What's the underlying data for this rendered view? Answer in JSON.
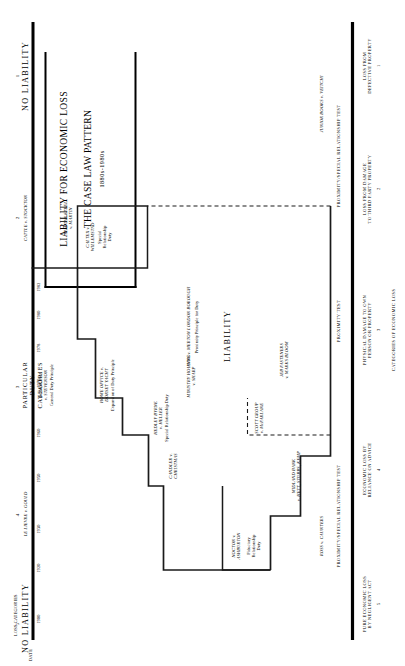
{
  "diagram": {
    "title_line1": "LIABILITY FOR ECONOMIC LOSS",
    "title_line2": "THE CASE LAW PATTERN",
    "title_sub": "1880s-1980s"
  },
  "axes": {
    "date_axis_label": "DATE",
    "loss_categories_label": "LOSS CATEGORIES",
    "dates": [
      "1900",
      "1920",
      "1930",
      "1950",
      "1960",
      "1970",
      "1978",
      "1980",
      "1982"
    ]
  },
  "column_numbers": [
    "5",
    "4",
    "3",
    "2",
    "1"
  ],
  "zones": [
    {
      "label": "NO LIABILITY",
      "id": "no-liability-left"
    },
    {
      "label": "LIABILITY",
      "id": "liability"
    },
    {
      "label": "NO LIABILITY",
      "id": "no-liability-right"
    }
  ],
  "column_headers": [
    {
      "num": "5",
      "name": ""
    },
    {
      "num": "4",
      "name": "LE LIEVRE v. GOULD"
    },
    {
      "num": "3",
      "name": "PARTICULAR DUTY CATEGORIES"
    },
    {
      "num": "2",
      "name": "CATTLE v. STOCKTON"
    },
    {
      "num": "1",
      "name": ""
    }
  ],
  "cases": [
    {
      "name": "LE LIEVRE v. GOULD",
      "sub": ""
    },
    {
      "name": "CATTLE v. STOCKTON",
      "sub": ""
    },
    {
      "name": "NOCTON v.\nASHBURTON",
      "sub": "Fiduciary\nRelationship\nDuty"
    },
    {
      "name": "CANDLER v.\nCHRISTMAS",
      "sub": ""
    },
    {
      "name": "DONOGHUE\nv. STEVENSON",
      "sub": "General Duty Principle"
    },
    {
      "name": "HEDLEY BYRNE\nv. HELLER",
      "sub": "Special Relationship Duty"
    },
    {
      "name": "HOME OFFICE v.\nDORSET YACHT",
      "sub": "Expansion of Duty Principle"
    },
    {
      "name": "MINISTRY HOUSING\nv. SHARP",
      "sub": ""
    },
    {
      "name": "SCOTT GROUP\nv. McFARLANE",
      "sub": ""
    },
    {
      "name": "SPARTAN STEEL\nv. MARTIN",
      "sub": ""
    },
    {
      "name": "CALTEX v.\nWILLEMSTAD",
      "sub": "Special\nRelationship\nDuty"
    },
    {
      "name": "ANNS v. MERTON LONDON BOROUGH",
      "sub": "Proximity Principle for Duty"
    },
    {
      "name": "MIDLAND BANK\nv. HETT, STUBBS, KEMP",
      "sub": ""
    },
    {
      "name": "JEB FASTENERS\nv. MARKS BLOOM",
      "sub": ""
    },
    {
      "name": "ROSS v. CAUNTERS",
      "sub": ""
    },
    {
      "name": "JUNIOR BOOKS v. VEITCHI",
      "sub": ""
    }
  ],
  "tests": [
    {
      "label": "PROXIMITY/SPECIAL RELATIONSHIP TEST",
      "id": "test-left"
    },
    {
      "label": "PROXIMITY TEST",
      "id": "test-mid"
    },
    {
      "label": "PROXIMITY/SPECIAL RELATIONSHIP TEST",
      "id": "test-right"
    }
  ],
  "footer_categories": {
    "heading": "CATEGORIES OF ECONOMIC LOSS",
    "items": [
      {
        "num": "5",
        "text": "PURE ECONOMIC LOSS\nBY NEGLIGENT ACT"
      },
      {
        "num": "4",
        "text": "ECONOMIC LOSS BY\nRELIANCE ON ADVICE"
      },
      {
        "num": "3",
        "text": "PHYSICAL DAMAGE TO OWN\nPERSON OR PROPERTY"
      },
      {
        "num": "2",
        "text": "LOSS FROM DAMAGE\nTO THIRD PARTY PROPERTY"
      },
      {
        "num": "1",
        "text": "LOSS FROM\nDEFECTIVE PROPERTY"
      }
    ]
  },
  "colors": {
    "ink": "#000000",
    "paper": "#ffffff",
    "rule": "#111111"
  }
}
